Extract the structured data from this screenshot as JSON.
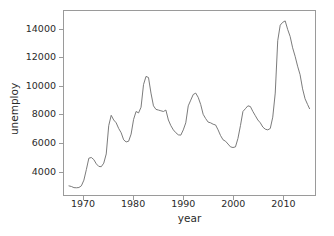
{
  "chart_data": {
    "type": "line",
    "title": "",
    "xlabel": "year",
    "ylabel": "unemploy",
    "xlim": [
      1966.0,
      1916.0
    ],
    "xlim_actual": [
      1966.0,
      2016.5
    ],
    "ylim": [
      2300,
      15300
    ],
    "grid": false,
    "legend": null,
    "line_color": "#6b6b6b",
    "line_width": 0.9,
    "xticks": [
      1970,
      1980,
      1990,
      2000,
      2010
    ],
    "xticklabels": [
      "1970",
      "1980",
      "1990",
      "2000",
      "2010"
    ],
    "yticks": [
      4000,
      6000,
      8000,
      10000,
      12000,
      14000
    ],
    "yticklabels": [
      "4000",
      "6000",
      "8000",
      "10000",
      "12000",
      "14000"
    ],
    "series": [
      {
        "name": "unemploy",
        "x": [
          1967.0,
          1967.5,
          1968.0,
          1968.5,
          1969.0,
          1969.5,
          1970.0,
          1970.5,
          1971.0,
          1971.5,
          1972.0,
          1972.5,
          1973.0,
          1973.5,
          1974.0,
          1974.5,
          1975.0,
          1975.5,
          1976.0,
          1976.5,
          1977.0,
          1977.5,
          1978.0,
          1978.5,
          1979.0,
          1979.5,
          1980.0,
          1980.5,
          1981.0,
          1981.5,
          1982.0,
          1982.5,
          1983.0,
          1983.5,
          1984.0,
          1984.5,
          1985.0,
          1985.5,
          1986.0,
          1986.5,
          1987.0,
          1987.5,
          1988.0,
          1988.5,
          1989.0,
          1989.5,
          1990.0,
          1990.5,
          1991.0,
          1991.5,
          1992.0,
          1992.5,
          1993.0,
          1993.5,
          1994.0,
          1994.5,
          1995.0,
          1995.5,
          1996.0,
          1996.5,
          1997.0,
          1997.5,
          1998.0,
          1998.5,
          1999.0,
          1999.5,
          2000.0,
          2000.5,
          2001.0,
          2001.5,
          2002.0,
          2002.5,
          2003.0,
          2003.5,
          2004.0,
          2004.5,
          2005.0,
          2005.5,
          2006.0,
          2006.5,
          2007.0,
          2007.5,
          2008.0,
          2008.5,
          2009.0,
          2009.5,
          2010.0,
          2010.5,
          2011.0,
          2011.5,
          2012.0,
          2012.5,
          2013.0,
          2013.5,
          2014.0,
          2014.5,
          2015.0,
          2015.4
        ],
        "y": [
          2944,
          2900,
          2820,
          2810,
          2830,
          2950,
          3350,
          4100,
          4900,
          4950,
          4800,
          4500,
          4320,
          4300,
          4550,
          5200,
          7200,
          7929,
          7600,
          7400,
          7000,
          6700,
          6200,
          6050,
          6100,
          6600,
          7640,
          8200,
          8100,
          8500,
          10100,
          10678,
          10600,
          9500,
          8600,
          8350,
          8300,
          8250,
          8200,
          8300,
          7600,
          7200,
          6900,
          6700,
          6550,
          6530,
          6900,
          7400,
          8600,
          9000,
          9400,
          9500,
          9200,
          8700,
          8000,
          7700,
          7450,
          7400,
          7300,
          7250,
          6900,
          6500,
          6200,
          6100,
          5900,
          5700,
          5655,
          5700,
          6300,
          7200,
          8200,
          8400,
          8600,
          8550,
          8200,
          7900,
          7600,
          7400,
          7100,
          6950,
          6900,
          7000,
          7800,
          9500,
          13200,
          14300,
          14500,
          14600,
          14000,
          13500,
          12700,
          12100,
          11400,
          10800,
          9800,
          9100,
          8700,
          8400
        ]
      }
    ]
  },
  "axes": {
    "xlabel": "year",
    "ylabel": "unemploy"
  }
}
